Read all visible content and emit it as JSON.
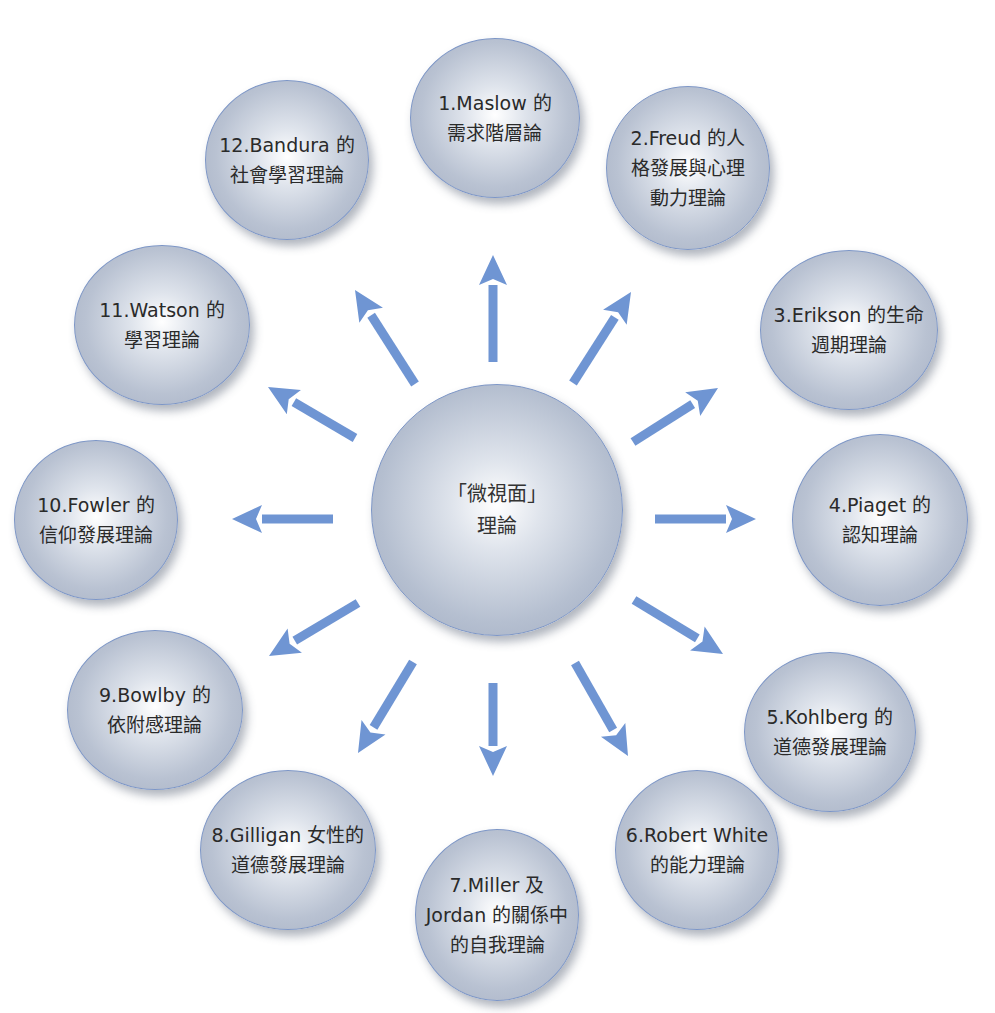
{
  "title": {
    "text_visible": "",
    "note": "",
    "color": "#4f7fd0"
  },
  "colors": {
    "arrow": "#6f95d3",
    "node_border": "#7d96c6",
    "text": "#2a2a2a"
  },
  "center": {
    "label": "「微視面」\n理論",
    "cx": 497,
    "cy": 510,
    "r": 126
  },
  "nodes": [
    {
      "id": 1,
      "label": "1.Maslow 的\n需求階層論",
      "cx": 495,
      "cy": 118,
      "rx": 85,
      "ry": 80
    },
    {
      "id": 2,
      "label": "2.Freud 的人\n格發展與心理\n動力理論",
      "cx": 688,
      "cy": 168,
      "rx": 82,
      "ry": 82
    },
    {
      "id": 3,
      "label": "3.Erikson 的生命\n週期理論",
      "cx": 849,
      "cy": 330,
      "rx": 89,
      "ry": 80
    },
    {
      "id": 4,
      "label": "4.Piaget 的\n認知理論",
      "cx": 880,
      "cy": 520,
      "rx": 88,
      "ry": 86
    },
    {
      "id": 5,
      "label": "5.Kohlberg 的\n道德發展理論",
      "cx": 830,
      "cy": 732,
      "rx": 86,
      "ry": 80
    },
    {
      "id": 6,
      "label": "6.Robert White\n的能力理論",
      "cx": 697,
      "cy": 850,
      "rx": 82,
      "ry": 80
    },
    {
      "id": 7,
      "label": "7.Miller 及\nJordan 的關係中\n的自我理論",
      "cx": 497,
      "cy": 915,
      "rx": 82,
      "ry": 86
    },
    {
      "id": 8,
      "label": "8.Gilligan 女性的\n道德發展理論",
      "cx": 288,
      "cy": 850,
      "rx": 88,
      "ry": 80
    },
    {
      "id": 9,
      "label": "9.Bowlby 的\n依附感理論",
      "cx": 155,
      "cy": 710,
      "rx": 88,
      "ry": 80
    },
    {
      "id": 10,
      "label": "10.Fowler 的\n信仰發展理論",
      "cx": 96,
      "cy": 520,
      "rx": 82,
      "ry": 80
    },
    {
      "id": 11,
      "label": "11.Watson 的\n學習理論",
      "cx": 162,
      "cy": 325,
      "rx": 88,
      "ry": 80
    },
    {
      "id": 12,
      "label": "12.Bandura 的\n社會學習理論",
      "cx": 287,
      "cy": 160,
      "rx": 82,
      "ry": 80
    }
  ],
  "arrows": [
    {
      "to": 1,
      "x1": 493,
      "y1": 362,
      "x2": 493,
      "y2": 255
    },
    {
      "to": 2,
      "x1": 573,
      "y1": 383,
      "x2": 631,
      "y2": 292
    },
    {
      "to": 3,
      "x1": 633,
      "y1": 442,
      "x2": 718,
      "y2": 388
    },
    {
      "to": 4,
      "x1": 655,
      "y1": 519,
      "x2": 756,
      "y2": 519
    },
    {
      "to": 5,
      "x1": 634,
      "y1": 600,
      "x2": 723,
      "y2": 654
    },
    {
      "to": 6,
      "x1": 575,
      "y1": 663,
      "x2": 628,
      "y2": 756
    },
    {
      "to": 7,
      "x1": 493,
      "y1": 683,
      "x2": 493,
      "y2": 776
    },
    {
      "to": 8,
      "x1": 413,
      "y1": 662,
      "x2": 358,
      "y2": 753
    },
    {
      "to": 9,
      "x1": 358,
      "y1": 603,
      "x2": 269,
      "y2": 656
    },
    {
      "to": 10,
      "x1": 333,
      "y1": 519,
      "x2": 232,
      "y2": 519
    },
    {
      "to": 11,
      "x1": 355,
      "y1": 438,
      "x2": 268,
      "y2": 387
    },
    {
      "to": 12,
      "x1": 415,
      "y1": 384,
      "x2": 355,
      "y2": 290
    }
  ]
}
